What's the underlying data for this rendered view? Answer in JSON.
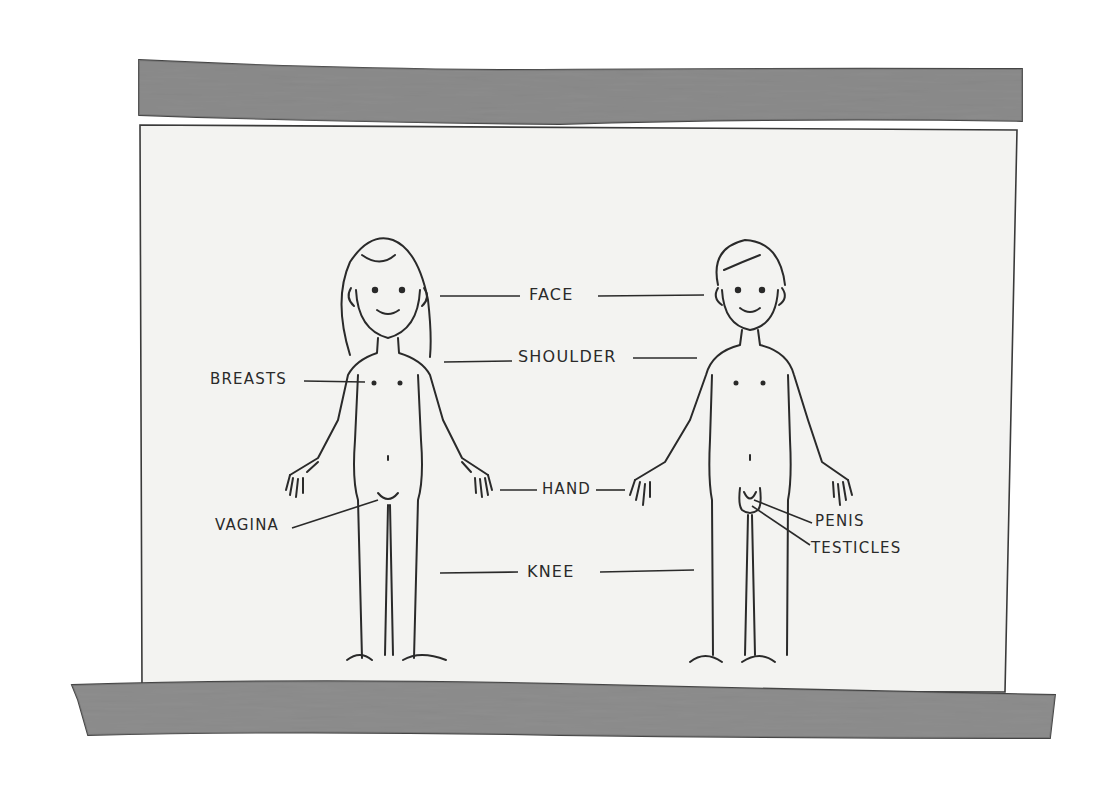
{
  "diagram": {
    "colors": {
      "background": "#ffffff",
      "chart_paper": "#f4f4f2",
      "roller_bar": "#8a8a8a",
      "ink": "#2a2a2a"
    },
    "figures": [
      {
        "id": "girl",
        "description": "girl figure (left)"
      },
      {
        "id": "boy",
        "description": "boy figure (right)"
      }
    ],
    "labels": {
      "face": "FACE",
      "shoulder": "SHOULDER",
      "breasts": "BREASTS",
      "hand": "HAND",
      "vagina": "VAGINA",
      "knee": "KNEE",
      "penis": "PENIS",
      "testicles": "TESTICLES"
    }
  }
}
